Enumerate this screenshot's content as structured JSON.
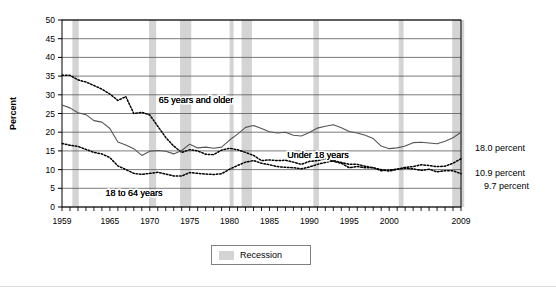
{
  "chart_data": {
    "type": "line",
    "title": "",
    "xlabel": "",
    "ylabel": "Percent",
    "ylim": [
      0,
      50
    ],
    "ytick_step": 5,
    "yticks": [
      "0",
      "5",
      "10",
      "15",
      "20",
      "25",
      "30",
      "35",
      "40",
      "45",
      "50"
    ],
    "xlim": [
      1959,
      2009
    ],
    "xticks_labeled": [
      "1959",
      "1965",
      "1970",
      "1975",
      "1980",
      "1985",
      "1990",
      "1995",
      "2000",
      "2009"
    ],
    "xtick_minor_every": 1,
    "grid": "horizontal",
    "legend_position": "bottom-center",
    "legend_entries": [
      {
        "label": "Recession",
        "swatch_color": "#d4d4d4",
        "type": "band"
      }
    ],
    "series": [
      {
        "name": "65 years and older",
        "style": "dotted",
        "color": "#000000",
        "end_label": "9.7 percent",
        "inline_label": "65 years and older",
        "x": [
          1959,
          1960,
          1961,
          1962,
          1963,
          1964,
          1965,
          1966,
          1967,
          1968,
          1969,
          1970,
          1971,
          1972,
          1973,
          1974,
          1975,
          1976,
          1977,
          1978,
          1979,
          1980,
          1981,
          1982,
          1983,
          1984,
          1985,
          1986,
          1987,
          1988,
          1989,
          1990,
          1991,
          1992,
          1993,
          1994,
          1995,
          1996,
          1997,
          1998,
          1999,
          2000,
          2001,
          2002,
          2003,
          2004,
          2005,
          2006,
          2007,
          2008,
          2009
        ],
        "values": [
          35.2,
          35.2,
          34.0,
          33.4,
          32.5,
          31.5,
          30.2,
          28.5,
          29.5,
          25.0,
          25.3,
          24.6,
          21.6,
          18.6,
          16.3,
          14.6,
          15.3,
          15.0,
          14.1,
          14.0,
          15.2,
          15.7,
          15.3,
          14.6,
          13.8,
          12.4,
          12.6,
          12.4,
          12.5,
          12.0,
          11.4,
          12.2,
          12.4,
          12.9,
          12.2,
          11.7,
          10.5,
          10.8,
          10.5,
          10.5,
          9.7,
          9.9,
          10.1,
          10.4,
          10.2,
          9.8,
          10.1,
          9.4,
          9.7,
          9.7,
          8.9
        ]
      },
      {
        "name": "Under 18 years",
        "style": "solid",
        "color": "#555555",
        "end_label": "18.0 percent",
        "inline_label": "Under 18 years",
        "x": [
          1959,
          1960,
          1961,
          1962,
          1963,
          1964,
          1965,
          1966,
          1967,
          1968,
          1969,
          1970,
          1971,
          1972,
          1973,
          1974,
          1975,
          1976,
          1977,
          1978,
          1979,
          1980,
          1981,
          1982,
          1983,
          1984,
          1985,
          1986,
          1987,
          1988,
          1989,
          1990,
          1991,
          1992,
          1993,
          1994,
          1995,
          1996,
          1997,
          1998,
          1999,
          2000,
          2001,
          2002,
          2003,
          2004,
          2005,
          2006,
          2007,
          2008,
          2009
        ],
        "values": [
          27.3,
          26.5,
          25.2,
          24.7,
          23.1,
          22.7,
          21.0,
          17.4,
          16.6,
          15.6,
          13.8,
          14.9,
          15.1,
          14.9,
          14.2,
          15.1,
          16.8,
          15.8,
          16.0,
          15.7,
          16.0,
          17.9,
          19.5,
          21.3,
          21.8,
          21.0,
          20.1,
          19.8,
          20.0,
          19.2,
          19.0,
          19.9,
          21.1,
          21.6,
          22.0,
          21.2,
          20.2,
          19.8,
          19.2,
          18.3,
          16.3,
          15.6,
          15.8,
          16.3,
          17.2,
          17.3,
          17.1,
          16.9,
          17.6,
          18.5,
          20.0
        ]
      },
      {
        "name": "18 to 64 years",
        "style": "dotted",
        "color": "#000000",
        "end_label": "10.9 percent",
        "inline_label": "18 to 64 years",
        "x": [
          1959,
          1960,
          1961,
          1962,
          1963,
          1964,
          1965,
          1966,
          1967,
          1968,
          1969,
          1970,
          1971,
          1972,
          1973,
          1974,
          1975,
          1976,
          1977,
          1978,
          1979,
          1980,
          1981,
          1982,
          1983,
          1984,
          1985,
          1986,
          1987,
          1988,
          1989,
          1990,
          1991,
          1992,
          1993,
          1994,
          1995,
          1996,
          1997,
          1998,
          1999,
          2000,
          2001,
          2002,
          2003,
          2004,
          2005,
          2006,
          2007,
          2008,
          2009
        ],
        "values": [
          17.0,
          16.5,
          16.2,
          15.4,
          14.6,
          14.2,
          13.2,
          11.0,
          10.0,
          9.0,
          8.7,
          9.0,
          9.3,
          8.8,
          8.3,
          8.3,
          9.2,
          9.0,
          8.8,
          8.7,
          8.9,
          10.1,
          11.1,
          12.0,
          12.4,
          11.7,
          11.3,
          10.8,
          10.6,
          10.5,
          10.2,
          10.7,
          11.4,
          11.9,
          12.4,
          11.9,
          11.4,
          11.4,
          10.9,
          10.5,
          10.0,
          9.6,
          10.1,
          10.6,
          10.8,
          11.3,
          11.1,
          10.8,
          10.9,
          11.7,
          12.9
        ]
      }
    ],
    "recession_bands": [
      {
        "start": 1960.3,
        "end": 1961.1
      },
      {
        "start": 1969.9,
        "end": 1970.8
      },
      {
        "start": 1973.8,
        "end": 1975.2
      },
      {
        "start": 1980.0,
        "end": 1980.5
      },
      {
        "start": 1981.5,
        "end": 1982.8
      },
      {
        "start": 1990.5,
        "end": 1991.2
      },
      {
        "start": 2001.2,
        "end": 2001.8
      },
      {
        "start": 2007.9,
        "end": 2009.4
      }
    ],
    "end_labels": [
      {
        "text": "18.0 percent",
        "value": 18.0
      },
      {
        "text": "10.9 percent",
        "value": 10.9
      },
      {
        "text": "9.7 percent",
        "value": 9.7
      }
    ],
    "colors": {
      "recession_band": "#d4d4d4",
      "gridline": "#595959",
      "axis": "#000000",
      "under18_line": "#555555",
      "dotted_line": "#000000"
    }
  }
}
